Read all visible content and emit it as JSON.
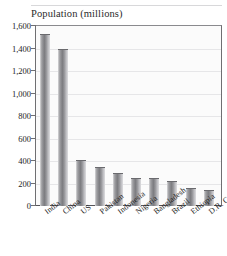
{
  "chart_data": {
    "type": "bar",
    "title": "Population (millions)",
    "xlabel": "",
    "ylabel": "",
    "ylim": [
      0,
      1600
    ],
    "grid": true,
    "legend": "none",
    "categories": [
      "India",
      "China",
      "US",
      "Pakistan",
      "Indonesia",
      "Nigeria",
      "Bangladesh",
      "Brazil",
      "Ethiopia",
      "D.R. Congo"
    ],
    "values": [
      1530,
      1395,
      405,
      345,
      290,
      250,
      245,
      220,
      162,
      140
    ],
    "ytick_labels": [
      "1,600",
      "1,400",
      "1,200",
      "1,000",
      "800",
      "600",
      "400",
      "200",
      "0"
    ],
    "ytick_values": [
      1600,
      1400,
      1200,
      1000,
      800,
      600,
      400,
      200,
      0
    ]
  },
  "colors": {
    "bar_mid": "#7d7d81",
    "bar_light": "#dddde0",
    "axis": "#6f6f72",
    "grid": "#e6e6e8",
    "plot_bg": "#fbfbfb",
    "text": "#1d1d1d"
  }
}
